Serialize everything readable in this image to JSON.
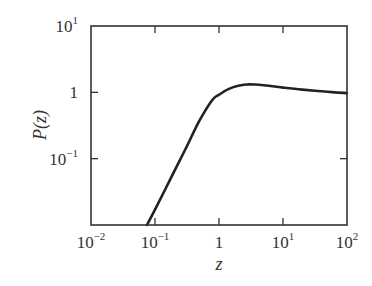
{
  "chart_data": {
    "type": "line",
    "title": "",
    "xlabel": "z",
    "ylabel": "P(z)",
    "xscale": "log",
    "yscale": "log",
    "xlim": [
      0.01,
      100
    ],
    "ylim": [
      0.01,
      10
    ],
    "grid": false,
    "legend": null,
    "x_ticks": [
      {
        "value": 0.01,
        "base": "10",
        "exp": "−2"
      },
      {
        "value": 0.1,
        "base": "10",
        "exp": "−1"
      },
      {
        "value": 1,
        "base": "1",
        "exp": ""
      },
      {
        "value": 10,
        "base": "10",
        "exp": "1"
      },
      {
        "value": 100,
        "base": "10",
        "exp": "2"
      }
    ],
    "y_ticks": [
      {
        "value": 0.1,
        "base": "10",
        "exp": "−1"
      },
      {
        "value": 1,
        "base": "1",
        "exp": ""
      },
      {
        "value": 10,
        "base": "10",
        "exp": "1"
      }
    ],
    "series": [
      {
        "name": "P(z)",
        "color": "#222222",
        "x": [
          0.075,
          0.1,
          0.17,
          0.3,
          0.5,
          0.78,
          1.0,
          1.4,
          2.0,
          3.0,
          5.0,
          10,
          20,
          50,
          100
        ],
        "y": [
          0.01,
          0.017,
          0.047,
          0.14,
          0.38,
          0.76,
          0.92,
          1.12,
          1.26,
          1.32,
          1.28,
          1.18,
          1.1,
          1.02,
          0.97
        ]
      }
    ]
  }
}
